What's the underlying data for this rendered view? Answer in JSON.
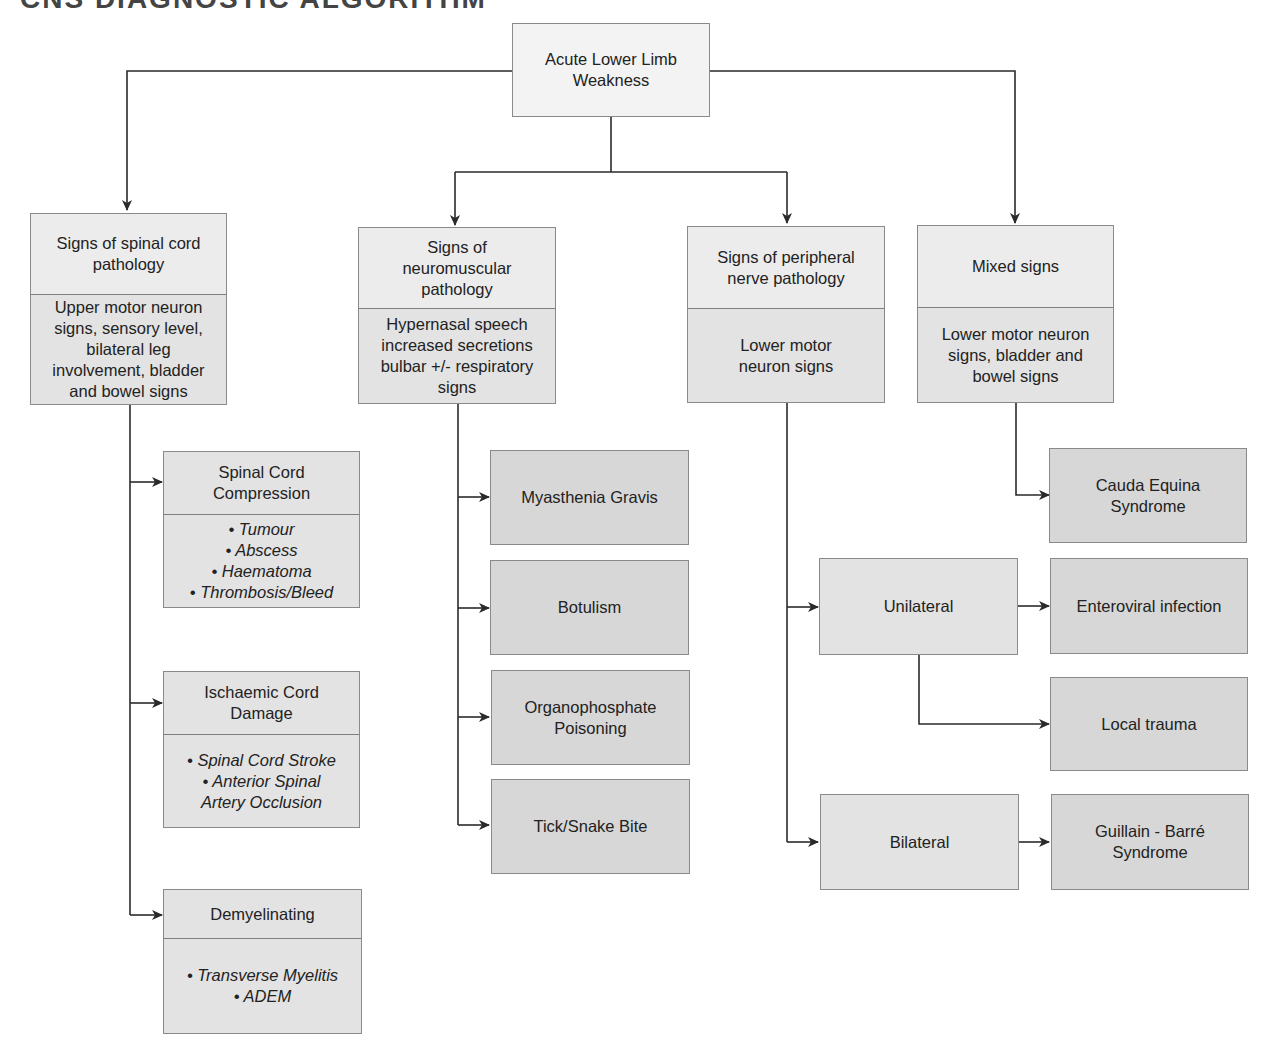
{
  "title_fragment": "CNS DIAGNOSTIC ALGORITHM",
  "root": {
    "label": "Acute Lower Limb\nWeakness"
  },
  "categories": [
    {
      "header": "Signs of spinal cord\npathology",
      "detail": "Upper motor neuron\nsigns, sensory level,\nbilateral leg\ninvolvement, bladder\nand bowel signs",
      "outcomes": [
        {
          "label": "Spinal Cord\nCompression",
          "items": [
            "• Tumour",
            "• Abscess",
            "• Haematoma",
            "• Thrombosis/Bleed"
          ]
        },
        {
          "label": "Ischaemic Cord\nDamage",
          "items": [
            "• Spinal Cord Stroke",
            "• Anterior Spinal",
            "Artery Occlusion"
          ]
        },
        {
          "label": "Demyelinating",
          "items": [
            "• Transverse Myelitis",
            "• ADEM"
          ]
        }
      ]
    },
    {
      "header": "Signs of\nneuromuscular\npathology",
      "detail": "Hypernasal speech\nincreased secretions\nbulbar +/- respiratory\nsigns",
      "outcomes": [
        {
          "label": "Myasthenia Gravis"
        },
        {
          "label": "Botulism"
        },
        {
          "label": "Organophosphate\nPoisoning"
        },
        {
          "label": "Tick/Snake Bite"
        }
      ]
    },
    {
      "header": "Signs of peripheral\nnerve pathology",
      "detail": "Lower motor\nneuron signs",
      "branches": [
        {
          "label": "Unilateral",
          "outcomes": [
            "Enteroviral infection",
            "Local trauma"
          ]
        },
        {
          "label": "Bilateral",
          "outcomes": [
            "Guillain - Barré\nSyndrome"
          ]
        }
      ]
    },
    {
      "header": "Mixed signs",
      "detail": "Lower motor neuron\nsigns, bladder and\nbowel signs",
      "outcomes": [
        {
          "label": "Cauda Equina\nSyndrome"
        }
      ]
    }
  ],
  "colors": {
    "line": "#2a2a2a",
    "box_light": "#ececec",
    "box_dark": "#d7d7d7",
    "border": "#8a8a8a"
  }
}
